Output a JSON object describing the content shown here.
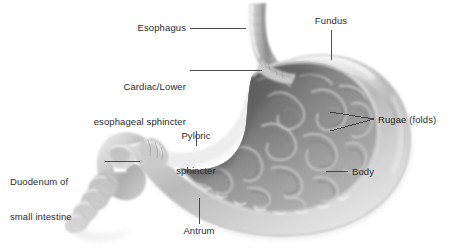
{
  "figure": {
    "background_color": "#ffffff",
    "label_color": "#2b2b2b",
    "leader_color": "#3a3a3a"
  },
  "labels": {
    "esophagus": "Esophagus",
    "cardiac_line1": "Cardiac/Lower",
    "cardiac_line2": "esophageal sphincter",
    "pyloric_line1": "Pyloric",
    "pyloric_line2": "sphincter",
    "duodenum_line1": "Duodenum of",
    "duodenum_line2": "small intestine",
    "antrum": "Antrum",
    "fundus": "Fundus",
    "rugae": "Rugae (folds)",
    "body": "Body"
  },
  "structures": [
    {
      "name": "esophagus",
      "label": "Esophagus"
    },
    {
      "name": "cardiac-lower-esophageal-sphincter",
      "label": "Cardiac/Lower esophageal sphincter"
    },
    {
      "name": "pyloric-sphincter",
      "label": "Pyloric sphincter"
    },
    {
      "name": "duodenum-of-small-intestine",
      "label": "Duodenum of small intestine"
    },
    {
      "name": "antrum",
      "label": "Antrum"
    },
    {
      "name": "fundus",
      "label": "Fundus"
    },
    {
      "name": "rugae-folds",
      "label": "Rugae (folds)"
    },
    {
      "name": "body",
      "label": "Body"
    }
  ]
}
